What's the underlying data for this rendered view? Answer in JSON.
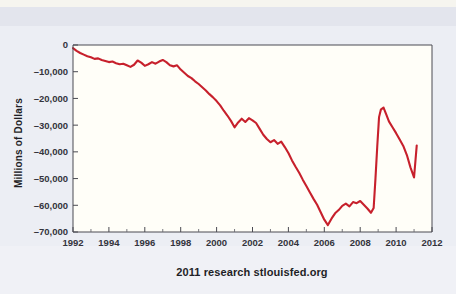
{
  "chart_data": {
    "type": "line",
    "title": "",
    "subtitle": "",
    "caption": "2011 research stlouisfed.org",
    "xlabel": "",
    "ylabel": "Millions of Dollars",
    "xlim": [
      1992,
      2012
    ],
    "ylim": [
      -70000,
      0
    ],
    "xticks": [
      1992,
      1994,
      1996,
      1998,
      2000,
      2002,
      2004,
      2006,
      2008,
      2010,
      2012
    ],
    "xtick_labels": [
      "1992",
      "1994",
      "1996",
      "1998",
      "2000",
      "2002",
      "2004",
      "2006",
      "2008",
      "2010",
      "2012"
    ],
    "yticks": [
      0,
      -10000,
      -20000,
      -30000,
      -40000,
      -50000,
      -60000,
      -70000
    ],
    "ytick_labels": [
      "0",
      "–10,000",
      "–20,000",
      "–30,000",
      "–40,000",
      "–50,000",
      "–60,000",
      "–70,000"
    ],
    "grid": false,
    "legend": false,
    "line_color": "#c7202c",
    "plot_background": "#fffef8",
    "page_background": "#eceef4",
    "series": [
      {
        "name": "Balance",
        "color": "#c7202c",
        "x": [
          1992.0,
          1992.2,
          1992.4,
          1992.6,
          1992.8,
          1993.0,
          1993.2,
          1993.4,
          1993.6,
          1993.8,
          1994.0,
          1994.2,
          1994.4,
          1994.6,
          1994.8,
          1995.0,
          1995.2,
          1995.4,
          1995.6,
          1995.8,
          1996.0,
          1996.2,
          1996.4,
          1996.6,
          1996.8,
          1997.0,
          1997.2,
          1997.4,
          1997.6,
          1997.8,
          1998.0,
          1998.2,
          1998.4,
          1998.6,
          1998.8,
          1999.0,
          1999.2,
          1999.4,
          1999.6,
          1999.8,
          2000.0,
          2000.2,
          2000.4,
          2000.6,
          2000.8,
          2001.0,
          2001.2,
          2001.4,
          2001.6,
          2001.8,
          2002.0,
          2002.2,
          2002.4,
          2002.6,
          2002.8,
          2003.0,
          2003.2,
          2003.4,
          2003.6,
          2003.8,
          2004.0,
          2004.2,
          2004.4,
          2004.6,
          2004.8,
          2005.0,
          2005.2,
          2005.4,
          2005.6,
          2005.8,
          2006.0,
          2006.2,
          2006.4,
          2006.6,
          2006.8,
          2007.0,
          2007.2,
          2007.4,
          2007.6,
          2007.8,
          2008.0,
          2008.2,
          2008.4,
          2008.6,
          2008.75,
          2008.85,
          2008.95,
          2009.05,
          2009.15,
          2009.3,
          2009.45,
          2009.6,
          2009.8,
          2010.0,
          2010.2,
          2010.4,
          2010.6,
          2010.8,
          2011.0,
          2011.15
        ],
        "y": [
          -1200,
          -2200,
          -3000,
          -3600,
          -4200,
          -4600,
          -5200,
          -5000,
          -5600,
          -6000,
          -6400,
          -6200,
          -6800,
          -7200,
          -7000,
          -7600,
          -8200,
          -7400,
          -5800,
          -6600,
          -7800,
          -7200,
          -6400,
          -7000,
          -6200,
          -5600,
          -6400,
          -7600,
          -8000,
          -7600,
          -9200,
          -10400,
          -11600,
          -12400,
          -13600,
          -14600,
          -15800,
          -17000,
          -18400,
          -19600,
          -21000,
          -22600,
          -24600,
          -26400,
          -28400,
          -30800,
          -29000,
          -27600,
          -28800,
          -27400,
          -28200,
          -29200,
          -31400,
          -33600,
          -35200,
          -36400,
          -35600,
          -37000,
          -36200,
          -38200,
          -40400,
          -43200,
          -45600,
          -47800,
          -50400,
          -52800,
          -55200,
          -57600,
          -59800,
          -62600,
          -65400,
          -67400,
          -65000,
          -63000,
          -61800,
          -60200,
          -59400,
          -60400,
          -58800,
          -59200,
          -58400,
          -59800,
          -61200,
          -62800,
          -61000,
          -50000,
          -38000,
          -27000,
          -24200,
          -23400,
          -26000,
          -28600,
          -30800,
          -33000,
          -35400,
          -37800,
          -41200,
          -45800,
          -49600,
          -37600
        ]
      }
    ],
    "annotations": {
      "peak_2009": {
        "x": 2009.3,
        "y": -23400
      },
      "trough_2006": {
        "x": 2006.2,
        "y": -67400
      },
      "end_point": {
        "x": 2011.15,
        "y": -37600
      }
    }
  },
  "axes": {
    "y_title": "Millions of Dollars",
    "caption": "2011 research stlouisfed.org"
  }
}
